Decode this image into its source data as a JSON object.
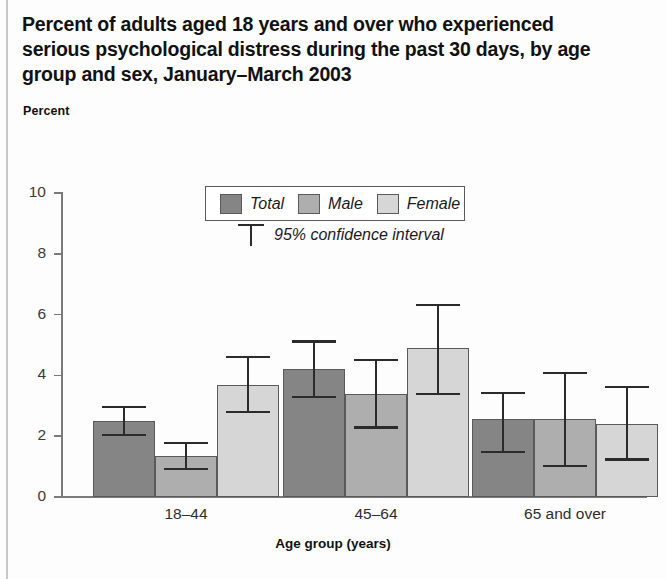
{
  "title": "Percent of adults aged 18 years and over who experienced serious psychological distress during the past 30 days, by age group and sex, January–March 2003",
  "percent_label": "Percent",
  "legend": {
    "items": [
      {
        "label": "Total",
        "key": "total",
        "color": "#858585"
      },
      {
        "label": "Male",
        "key": "male",
        "color": "#aeaeae"
      },
      {
        "label": "Female",
        "key": "female",
        "color": "#d6d6d6"
      }
    ],
    "ci_label": "95% confidence interval",
    "ci_icon": "error-bar-icon"
  },
  "chart_data": {
    "type": "bar",
    "title": "Percent of adults aged 18 years and over who experienced serious psychological distress during the past 30 days, by age group and sex, January–March 2003",
    "subtitle": "Percent",
    "xlabel": "Age group (years)",
    "ylabel": "Percent",
    "ylim": [
      0,
      10
    ],
    "yticks": [
      0,
      2,
      4,
      6,
      8,
      10
    ],
    "ytick_labels": [
      "0",
      "2",
      "4",
      "6",
      "8",
      "10"
    ],
    "grid": false,
    "legend_position": "upper-center",
    "error_bars": "95% confidence interval",
    "categories": [
      "18–44",
      "45–64",
      "65 and over"
    ],
    "series": [
      {
        "name": "Total",
        "color": "#858585",
        "values": [
          2.5,
          4.2,
          2.55
        ],
        "ci_low": [
          2.0,
          3.25,
          1.45
        ],
        "ci_high": [
          3.0,
          5.15,
          3.45
        ]
      },
      {
        "name": "Male",
        "color": "#aeaeae",
        "values": [
          1.35,
          3.4,
          2.55
        ],
        "ci_low": [
          0.9,
          2.25,
          1.0
        ],
        "ci_high": [
          1.8,
          4.55,
          4.1
        ]
      },
      {
        "name": "Female",
        "color": "#d6d6d6",
        "values": [
          3.7,
          4.9,
          2.4
        ],
        "ci_low": [
          2.75,
          3.35,
          1.2
        ],
        "ci_high": [
          4.65,
          6.35,
          3.65
        ]
      }
    ]
  },
  "axis": {
    "x_title": "Age group (years)"
  }
}
